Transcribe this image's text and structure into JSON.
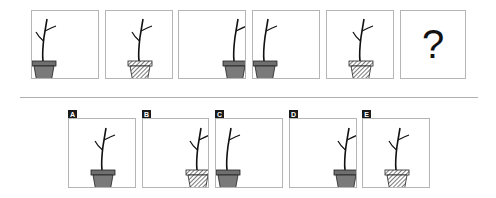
{
  "puzzle": {
    "sequence": [
      {
        "pot": "solid",
        "position": "left",
        "branches": "two-side"
      },
      {
        "pot": "striped",
        "position": "center",
        "branches": "two-side"
      },
      {
        "pot": "solid",
        "position": "right",
        "branches": "one-side"
      },
      {
        "pot": "solid",
        "position": "left",
        "branches": "one-side"
      },
      {
        "pot": "striped",
        "position": "center",
        "branches": "two-side"
      },
      {
        "missing": true,
        "symbol": "?"
      }
    ],
    "options": [
      {
        "label": "A",
        "pot": "solid",
        "position": "center",
        "branches": "two-side"
      },
      {
        "label": "B",
        "pot": "striped",
        "position": "right",
        "branches": "two-side"
      },
      {
        "label": "C",
        "pot": "solid",
        "position": "left",
        "branches": "one-side"
      },
      {
        "label": "D",
        "pot": "solid",
        "position": "right",
        "branches": "two-side"
      },
      {
        "label": "E",
        "pot": "striped",
        "position": "center",
        "branches": "two-side"
      }
    ]
  },
  "colors": {
    "pot_solid": "#7a7a7a",
    "pot_outline": "#222222",
    "border": "#b5b5b5",
    "label_bg": "#1a1a1a"
  }
}
